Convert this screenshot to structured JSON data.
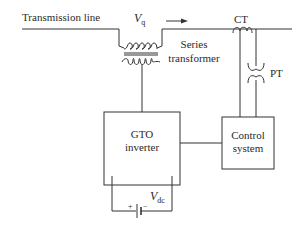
{
  "diagram": {
    "type": "block-diagram",
    "labels": {
      "transmission_line": "Transmission line",
      "vq_main": "V",
      "vq_sub": "q",
      "ct": "CT",
      "series_transformer_line1": "Series",
      "series_transformer_line2": "transformer",
      "pt": "PT",
      "gto_line1": "GTO",
      "gto_line2": "inverter",
      "control_line1": "Control",
      "control_line2": "system",
      "vdc_main": "V",
      "vdc_sub": "dc",
      "plus": "+",
      "minus": "−"
    },
    "nodes": [
      {
        "id": "transmission-line",
        "label": "Transmission line"
      },
      {
        "id": "series-transformer",
        "label": "Series transformer"
      },
      {
        "id": "ct",
        "label": "CT"
      },
      {
        "id": "pt",
        "label": "PT"
      },
      {
        "id": "gto-inverter",
        "label": "GTO inverter"
      },
      {
        "id": "control-system",
        "label": "Control system"
      },
      {
        "id": "dc-source",
        "label": "Vdc"
      }
    ],
    "edges": [
      {
        "from": "transmission-line",
        "to": "series-transformer"
      },
      {
        "from": "series-transformer",
        "to": "gto-inverter"
      },
      {
        "from": "ct",
        "to": "control-system"
      },
      {
        "from": "pt",
        "to": "control-system"
      },
      {
        "from": "gto-inverter",
        "to": "control-system"
      },
      {
        "from": "dc-source",
        "to": "gto-inverter"
      }
    ],
    "colors": {
      "stroke": "#333333",
      "text": "#2a2a2a",
      "background": "#ffffff"
    }
  }
}
